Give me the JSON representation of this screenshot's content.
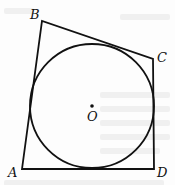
{
  "figure": {
    "vertices": [
      {
        "label": "A",
        "x": 22,
        "y": 169,
        "label_x": 8,
        "label_y": 177
      },
      {
        "label": "B",
        "x": 42,
        "y": 21,
        "label_x": 30,
        "label_y": 19
      },
      {
        "label": "C",
        "x": 153,
        "y": 59,
        "label_x": 157,
        "label_y": 62
      },
      {
        "label": "D",
        "x": 154,
        "y": 169,
        "label_x": 157,
        "label_y": 177
      }
    ],
    "circle": {
      "center_label": "O",
      "cx": 92,
      "cy": 106,
      "r": 62,
      "label_x": 88,
      "label_y": 121
    },
    "stroke_color": "#111111"
  }
}
